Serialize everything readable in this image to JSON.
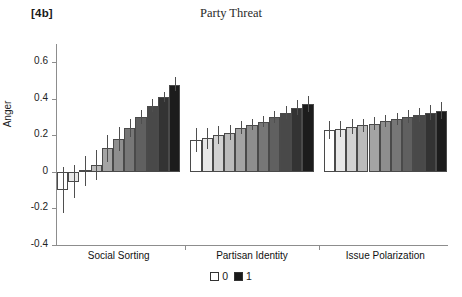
{
  "figure": {
    "panel_label": "[4b]",
    "title": "Party Threat"
  },
  "legend": {
    "items": [
      {
        "label": "0",
        "color": "#ffffff"
      },
      {
        "label": "1",
        "color": "#1a1a1a"
      }
    ]
  },
  "chart_data": {
    "type": "bar",
    "title": "Party Threat",
    "xlabel": "",
    "ylabel": "Anger",
    "ylim": [
      -0.4,
      0.7
    ],
    "yticks": [
      0.6,
      0.4,
      0.2,
      0,
      -0.2,
      -0.4
    ],
    "ytick_labels": [
      "0.6",
      "0.4",
      "0.2",
      "0",
      "-0.2",
      "-0.4"
    ],
    "grid": false,
    "legend_position": "bottom",
    "error_bars": true,
    "panels": [
      {
        "name": "Social Sorting",
        "categories": [
          "0",
          "0.1",
          "0.2",
          "0.3",
          "0.4",
          "0.5",
          "0.6",
          "0.7",
          "0.8",
          "0.9",
          "1"
        ],
        "values": [
          -0.1,
          -0.053,
          0.007,
          0.038,
          0.13,
          0.18,
          0.24,
          0.3,
          0.362,
          0.41,
          0.475
        ],
        "err_low": [
          -0.227,
          -0.145,
          -0.075,
          -0.043,
          0.055,
          0.115,
          0.19,
          0.262,
          0.33,
          0.385,
          0.443
        ],
        "err_high": [
          0.028,
          0.04,
          0.085,
          0.122,
          0.2,
          0.245,
          0.292,
          0.34,
          0.398,
          0.44,
          0.52
        ]
      },
      {
        "name": "Partisan Identity",
        "categories": [
          "0",
          "0.1",
          "0.2",
          "0.3",
          "0.4",
          "0.5",
          "0.6",
          "0.7",
          "0.8",
          "0.9",
          "1"
        ],
        "values": [
          0.175,
          0.185,
          0.2,
          0.215,
          0.24,
          0.258,
          0.272,
          0.298,
          0.325,
          0.35,
          0.37
        ],
        "err_low": [
          0.108,
          0.128,
          0.152,
          0.175,
          0.205,
          0.228,
          0.245,
          0.268,
          0.292,
          0.312,
          0.328
        ],
        "err_high": [
          0.238,
          0.24,
          0.25,
          0.258,
          0.278,
          0.292,
          0.305,
          0.332,
          0.362,
          0.392,
          0.415
        ]
      },
      {
        "name": "Issue Polarization",
        "categories": [
          "0",
          "0.1",
          "0.2",
          "0.3",
          "0.4",
          "0.5",
          "0.6",
          "0.7",
          "0.8",
          "0.9",
          "1"
        ],
        "values": [
          0.23,
          0.235,
          0.245,
          0.255,
          0.265,
          0.278,
          0.29,
          0.302,
          0.312,
          0.325,
          0.335
        ],
        "err_low": [
          0.18,
          0.192,
          0.205,
          0.218,
          0.23,
          0.245,
          0.258,
          0.268,
          0.275,
          0.285,
          0.292
        ],
        "err_high": [
          0.278,
          0.28,
          0.288,
          0.292,
          0.3,
          0.312,
          0.325,
          0.338,
          0.35,
          0.365,
          0.38
        ]
      }
    ]
  }
}
